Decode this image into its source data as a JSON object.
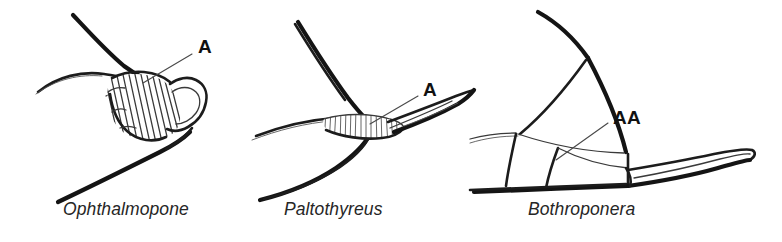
{
  "figure": {
    "type": "scientific-line-illustration",
    "background_color": "#ffffff",
    "ink_color": "#141414",
    "panel_count": 3
  },
  "panels": [
    {
      "id": "ophthalmopone",
      "genus_label": "Ophthalmopone",
      "callout_label": "A",
      "callout_meaning": "stridulitrum",
      "texture": "coarse oblique striations",
      "striation_count": 13
    },
    {
      "id": "paltothyreus",
      "genus_label": "Paltothyreus",
      "callout_label": "A",
      "callout_meaning": "stridulitrum",
      "texture": "fine dense vertical striations",
      "striation_count": 16
    },
    {
      "id": "bothroponera",
      "genus_label": "Bothroponera",
      "callout_label": "AA",
      "callout_meaning": "stridulitrum absent",
      "texture": "smooth unsculptured",
      "striation_count": 0
    }
  ]
}
